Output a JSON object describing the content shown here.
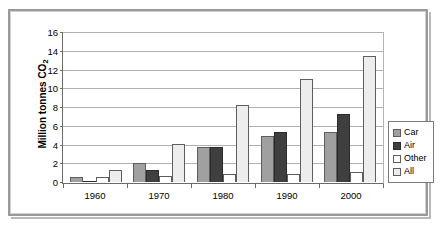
{
  "chart_data": {
    "type": "bar",
    "title": "",
    "xlabel": "",
    "ylabel": "Million tonnes CO2",
    "ylabel_prefix": "Million tonnes CO",
    "ylabel_subscript": "2",
    "categories": [
      "1960",
      "1970",
      "1980",
      "1990",
      "2000"
    ],
    "series": [
      {
        "name": "Car",
        "color": "#a0a0a0",
        "values": [
          0.5,
          2.1,
          3.8,
          5.0,
          5.45
        ]
      },
      {
        "name": "Air",
        "color": "#3f3f3f",
        "values": [
          0.15,
          1.3,
          3.8,
          5.45,
          7.3
        ]
      },
      {
        "name": "Other",
        "color": "#ffffff",
        "values": [
          0.5,
          0.7,
          0.85,
          0.9,
          1.1
        ]
      },
      {
        "name": "All",
        "color": "#ededed",
        "values": [
          1.3,
          4.1,
          8.3,
          11.1,
          13.65
        ]
      }
    ],
    "ylim": [
      0,
      16
    ],
    "ytick_step": 2,
    "yticks": [
      "0",
      "2",
      "4",
      "6",
      "8",
      "10",
      "12",
      "14",
      "16"
    ],
    "grid": true,
    "legend_position": "right-outside",
    "legend_entries": [
      "Car",
      "Air",
      "Other",
      "All"
    ]
  }
}
